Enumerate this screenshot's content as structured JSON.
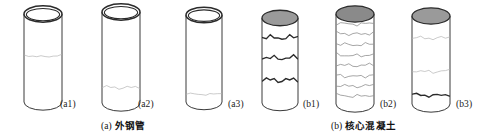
{
  "figure": {
    "width": 499,
    "height": 138,
    "background": "#ffffff",
    "type": "technical-illustration"
  },
  "style_tokens": {
    "outline_color": "#3a3a3a",
    "top_rim_color": "#2b2b2b",
    "tube_fill": "#ffffff",
    "concrete_top_fill": "#9a9a9a",
    "concrete_top_fill_dark": "#8a8a8a",
    "crack_dark": "#2a2a2a",
    "crack_faint": "#b4b4b4",
    "label_color": "#1a1a1a"
  },
  "specimens": [
    {
      "id": "a1",
      "label": "(a1)",
      "group": "a",
      "kind": "steel-tube",
      "top_style": "open-ring",
      "x": 24,
      "width": 38,
      "body_top": 14,
      "body_bottom": 102,
      "label_x": 60,
      "label_y": 99,
      "cracks": [
        {
          "y": 0.47,
          "weight": "faint",
          "wobble": 1
        }
      ]
    },
    {
      "id": "a2",
      "label": "(a2)",
      "group": "a",
      "kind": "steel-tube",
      "top_style": "open-ring",
      "x": 102,
      "width": 38,
      "body_top": 12,
      "body_bottom": 103,
      "label_x": 138,
      "label_y": 99,
      "cracks": [
        {
          "y": 0.82,
          "weight": "faint",
          "wobble": 2
        }
      ]
    },
    {
      "id": "a3",
      "label": "(a3)",
      "group": "a",
      "kind": "steel-tube",
      "top_style": "open-ring",
      "x": 186,
      "width": 36,
      "body_top": 15,
      "body_bottom": 102,
      "label_x": 228,
      "label_y": 99,
      "cracks": [
        {
          "y": 0.9,
          "weight": "faint",
          "wobble": 1
        }
      ]
    },
    {
      "id": "b1",
      "label": "(b1)",
      "group": "b",
      "kind": "concrete-core",
      "top_style": "filled-ellipse",
      "x": 262,
      "width": 36,
      "body_top": 18,
      "body_bottom": 103,
      "label_x": 303,
      "label_y": 99,
      "cracks": [
        {
          "y": 0.22,
          "weight": "dark",
          "wobble": 3
        },
        {
          "y": 0.46,
          "weight": "dark",
          "wobble": 3
        },
        {
          "y": 0.72,
          "weight": "dark",
          "wobble": 3
        }
      ]
    },
    {
      "id": "b2",
      "label": "(b2)",
      "group": "b",
      "kind": "concrete-core",
      "top_style": "filled-ellipse",
      "x": 336,
      "width": 38,
      "body_top": 14,
      "body_bottom": 104,
      "label_x": 380,
      "label_y": 99,
      "cracks": [
        {
          "y": 0.1,
          "weight": "medium",
          "wobble": 2
        },
        {
          "y": 0.21,
          "weight": "medium",
          "wobble": 2
        },
        {
          "y": 0.33,
          "weight": "medium",
          "wobble": 2
        },
        {
          "y": 0.45,
          "weight": "medium",
          "wobble": 2
        },
        {
          "y": 0.56,
          "weight": "medium",
          "wobble": 2
        },
        {
          "y": 0.68,
          "weight": "medium",
          "wobble": 2
        },
        {
          "y": 0.79,
          "weight": "medium",
          "wobble": 2
        },
        {
          "y": 0.9,
          "weight": "medium",
          "wobble": 2
        }
      ]
    },
    {
      "id": "b3",
      "label": "(b3)",
      "group": "b",
      "kind": "concrete-core",
      "top_style": "filled-ellipse",
      "x": 412,
      "width": 38,
      "body_top": 16,
      "body_bottom": 104,
      "label_x": 456,
      "label_y": 99,
      "cracks": [
        {
          "y": 0.24,
          "weight": "faint",
          "wobble": 2
        },
        {
          "y": 0.62,
          "weight": "faint",
          "wobble": 2
        },
        {
          "y": 0.89,
          "weight": "dark",
          "wobble": 2
        }
      ]
    }
  ],
  "group_captions": [
    {
      "id": "a",
      "index": "(a)",
      "text": "外钢管",
      "x": 101,
      "y": 118
    },
    {
      "id": "b",
      "index": "(b)",
      "text": "核心混凝土",
      "x": 331,
      "y": 118
    }
  ]
}
